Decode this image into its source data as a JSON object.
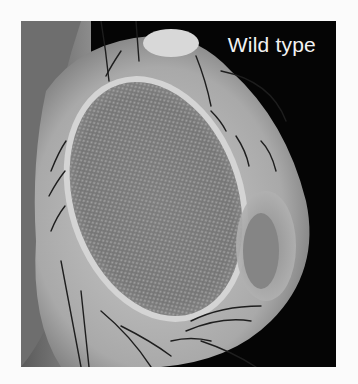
{
  "figure": {
    "label": "Wild type",
    "colors": {
      "background": "#050505",
      "label_text": "#f2f2f2",
      "page": "#fbfbfb"
    }
  }
}
